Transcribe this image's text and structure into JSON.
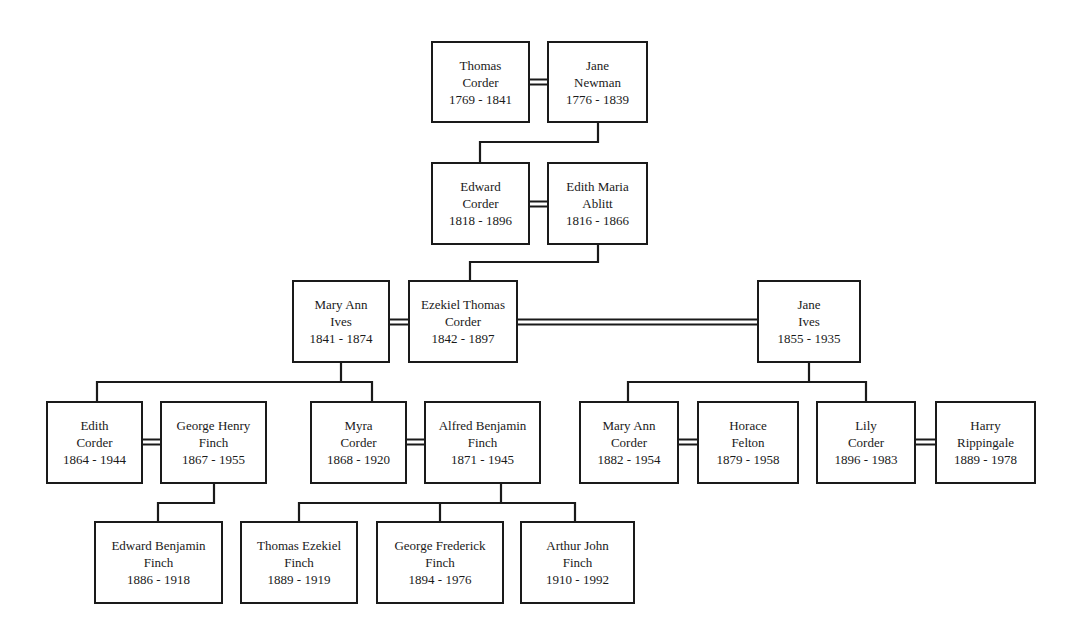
{
  "diagram": {
    "type": "family-tree",
    "people": [
      {
        "id": "thomas_corder",
        "name1": "Thomas",
        "name2": "Corder",
        "years": "1769 - 1841",
        "box": [
          431,
          41,
          99,
          82
        ]
      },
      {
        "id": "jane_newman",
        "name1": "Jane",
        "name2": "Newman",
        "years": "1776 - 1839",
        "box": [
          547,
          41,
          101,
          82
        ]
      },
      {
        "id": "edward_corder",
        "name1": "Edward",
        "name2": "Corder",
        "years": "1818 - 1896",
        "box": [
          431,
          162,
          99,
          83
        ]
      },
      {
        "id": "edith_maria_ablitt",
        "name1": "Edith Maria",
        "name2": "Ablitt",
        "years": "1816 - 1866",
        "box": [
          547,
          162,
          101,
          83
        ]
      },
      {
        "id": "mary_ann_ives",
        "name1": "Mary Ann",
        "name2": "Ives",
        "years": "1841 - 1874",
        "box": [
          292,
          280,
          98,
          83
        ]
      },
      {
        "id": "ezekiel_thomas_corder",
        "name1": "Ezekiel Thomas",
        "name2": "Corder",
        "years": "1842 - 1897",
        "box": [
          408,
          280,
          110,
          83
        ]
      },
      {
        "id": "jane_ives",
        "name1": "Jane",
        "name2": "Ives",
        "years": "1855 - 1935",
        "box": [
          757,
          280,
          104,
          83
        ]
      },
      {
        "id": "edith_corder",
        "name1": "Edith",
        "name2": "Corder",
        "years": "1864 - 1944",
        "box": [
          46,
          401,
          97,
          83
        ]
      },
      {
        "id": "george_henry_finch",
        "name1": "George Henry",
        "name2": "Finch",
        "years": "1867 - 1955",
        "box": [
          160,
          401,
          107,
          83
        ]
      },
      {
        "id": "myra_corder",
        "name1": "Myra",
        "name2": "Corder",
        "years": "1868 - 1920",
        "box": [
          310,
          401,
          97,
          83
        ]
      },
      {
        "id": "alfred_benjamin_finch",
        "name1": "Alfred Benjamin",
        "name2": "Finch",
        "years": "1871 - 1945",
        "box": [
          424,
          401,
          117,
          83
        ]
      },
      {
        "id": "mary_ann_corder",
        "name1": "Mary Ann",
        "name2": "Corder",
        "years": "1882 - 1954",
        "box": [
          579,
          401,
          100,
          83
        ]
      },
      {
        "id": "horace_felton",
        "name1": "Horace",
        "name2": "Felton",
        "years": "1879 - 1958",
        "box": [
          697,
          401,
          102,
          83
        ]
      },
      {
        "id": "lily_corder",
        "name1": "Lily",
        "name2": "Corder",
        "years": "1896 - 1983",
        "box": [
          816,
          401,
          100,
          83
        ]
      },
      {
        "id": "harry_rippingale",
        "name1": "Harry",
        "name2": "Rippingale",
        "years": "1889 - 1978",
        "box": [
          935,
          401,
          101,
          83
        ]
      },
      {
        "id": "edward_benjamin_finch",
        "name1": "Edward Benjamin",
        "name2": "Finch",
        "years": "1886 - 1918",
        "box": [
          94,
          521,
          129,
          83
        ]
      },
      {
        "id": "thomas_ezekiel_finch",
        "name1": "Thomas Ezekiel",
        "name2": "Finch",
        "years": "1889 - 1919",
        "box": [
          240,
          521,
          118,
          83
        ]
      },
      {
        "id": "george_frederick_finch",
        "name1": "George Frederick",
        "name2": "Finch",
        "years": "1894 - 1976",
        "box": [
          376,
          521,
          128,
          83
        ]
      },
      {
        "id": "arthur_john_finch",
        "name1": "Arthur John",
        "name2": "Finch",
        "years": "1910 - 1992",
        "box": [
          520,
          521,
          115,
          83
        ]
      }
    ],
    "marriages": [
      {
        "a": "thomas_corder",
        "b": "jane_newman",
        "line": [
          530,
          547,
          82
        ]
      },
      {
        "a": "edward_corder",
        "b": "edith_maria_ablitt",
        "line": [
          530,
          547,
          204
        ]
      },
      {
        "a": "mary_ann_ives",
        "b": "ezekiel_thomas_corder",
        "line": [
          390,
          408,
          322
        ]
      },
      {
        "a": "ezekiel_thomas_corder",
        "b": "jane_ives",
        "line": [
          518,
          757,
          322
        ]
      },
      {
        "a": "edith_corder",
        "b": "george_henry_finch",
        "line": [
          143,
          160,
          442
        ]
      },
      {
        "a": "myra_corder",
        "b": "alfred_benjamin_finch",
        "line": [
          407,
          424,
          442
        ]
      },
      {
        "a": "mary_ann_corder",
        "b": "horace_felton",
        "line": [
          679,
          697,
          442
        ]
      },
      {
        "a": "lily_corder",
        "b": "harry_rippingale",
        "line": [
          916,
          935,
          442
        ]
      }
    ],
    "descent_paths": [
      "M598,123 V142 H480 V162",
      "M598,245 V262 H470 V280",
      "M341,363 V382 H97 V401",
      "M341,382 H372 V401",
      "M809,363 V382 H628 V401",
      "M809,382 H866 V401",
      "M214,484 V503 H158 V521",
      "M501,484 V503 H299 V521",
      "M440,503 V521",
      "M501,503 H575 V521"
    ],
    "colors": {
      "line": "#1a1a1a",
      "box_bg": "#ffffff",
      "text": "#1a1a1a"
    }
  }
}
